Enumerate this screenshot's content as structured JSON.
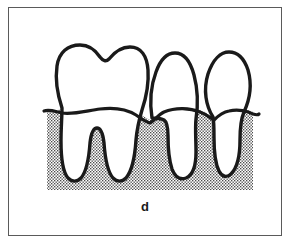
{
  "figure": {
    "caption": "d",
    "frame": {
      "border_color": "#5a5a5a",
      "background_color": "#ffffff"
    },
    "colors": {
      "outline": "#1a1a1a",
      "gum_stipple_dot": "#4a4a4a",
      "gum_background": "#ffffff",
      "tooth_fill": "#ffffff",
      "caption_color": "#1a1a1a"
    },
    "gum": {
      "label": "stippled bone / gum region",
      "left": 47,
      "right": 253,
      "top": 108,
      "bottom": 190,
      "pattern": "fine-dot-stipple"
    },
    "teeth": [
      {
        "name": "molar",
        "position": "left",
        "crown_shape": "bilobed with central occlusal notch",
        "root_count": 2,
        "crown_top_y": 45,
        "root_tip_y": 181
      },
      {
        "name": "premolar",
        "position": "middle",
        "crown_shape": "pointed ogive cusp",
        "root_count": 1,
        "crown_top_y": 53,
        "root_tip_y": 178
      },
      {
        "name": "premolar",
        "position": "right",
        "crown_shape": "pointed ogive cusp",
        "root_count": 1,
        "crown_top_y": 52,
        "root_tip_y": 176
      }
    ],
    "gumline": {
      "label": "gingival margin contour",
      "left_tail_x": 44,
      "right_tail_x": 259
    }
  }
}
